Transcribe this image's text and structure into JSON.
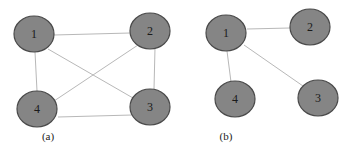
{
  "figures": [
    {
      "caption": "(a)",
      "nodes": [
        {
          "id": "1",
          "label": "1"
        },
        {
          "id": "2",
          "label": "2"
        },
        {
          "id": "3",
          "label": "3"
        },
        {
          "id": "4",
          "label": "4"
        }
      ],
      "edges": [
        [
          "1",
          "2"
        ],
        [
          "1",
          "3"
        ],
        [
          "1",
          "4"
        ],
        [
          "2",
          "3"
        ],
        [
          "2",
          "4"
        ],
        [
          "3",
          "4"
        ]
      ]
    },
    {
      "caption": "(b)",
      "nodes": [
        {
          "id": "1",
          "label": "1"
        },
        {
          "id": "2",
          "label": "2"
        },
        {
          "id": "3",
          "label": "3"
        },
        {
          "id": "4",
          "label": "4"
        }
      ],
      "edges": [
        [
          "1",
          "2"
        ],
        [
          "1",
          "3"
        ],
        [
          "1",
          "4"
        ]
      ]
    }
  ],
  "colors": {
    "node_fill": "#858585",
    "node_stroke": "#4a4a4a",
    "edge": "#b8b8b8"
  }
}
